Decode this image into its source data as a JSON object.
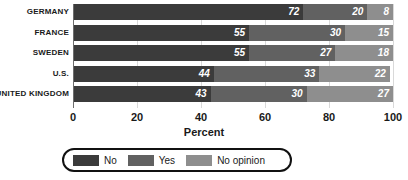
{
  "chart_data": {
    "type": "bar",
    "orientation": "horizontal",
    "stacked": true,
    "stack_mode": "percent",
    "title": "",
    "xlabel": "Percent",
    "ylabel": "",
    "xlim": [
      0,
      100
    ],
    "xticks": [
      0,
      20,
      40,
      60,
      80,
      100
    ],
    "xtick_labels": [
      "0",
      "20",
      "40",
      "60",
      "80",
      "100"
    ],
    "grid": true,
    "grid_axis": "x",
    "legend_position": "bottom",
    "categories": [
      "GERMANY",
      "FRANCE",
      "SWEDEN",
      "U.S.",
      "UNITED KINGDOM"
    ],
    "series": [
      {
        "name": "No",
        "color": "#3b3b3b",
        "values": [
          72,
          55,
          55,
          44,
          43
        ]
      },
      {
        "name": "Yes",
        "color": "#616161",
        "values": [
          20,
          30,
          27,
          33,
          30
        ]
      },
      {
        "name": "No opinion",
        "color": "#8e8e8e",
        "values": [
          8,
          15,
          18,
          22,
          27
        ]
      }
    ]
  },
  "legend": {
    "items": [
      {
        "label": "No",
        "color": "#3b3b3b"
      },
      {
        "label": "Yes",
        "color": "#616161"
      },
      {
        "label": "No opinion",
        "color": "#8e8e8e"
      }
    ]
  },
  "colors": {
    "no": "#3b3b3b",
    "yes": "#616161",
    "no_opinion": "#8e8e8e",
    "gridline": "#d9d9d9",
    "axis": "#6d6d6d",
    "text": "#1a1a1a",
    "value_text": "#ffffff",
    "legend_border": "#111111",
    "background": "#ffffff"
  }
}
